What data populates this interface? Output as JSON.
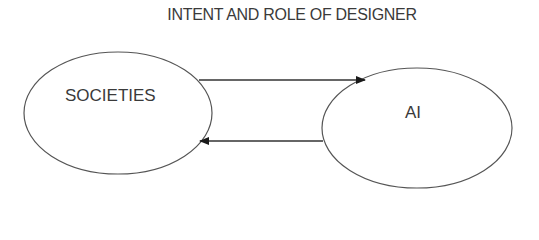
{
  "title": "INTENT AND ROLE OF DESIGNER",
  "nodes": [
    {
      "id": "societies",
      "label": "SOCIETIES"
    },
    {
      "id": "ai",
      "label": "AI"
    }
  ],
  "edges": [
    {
      "from": "societies",
      "to": "ai"
    },
    {
      "from": "ai",
      "to": "societies"
    }
  ]
}
